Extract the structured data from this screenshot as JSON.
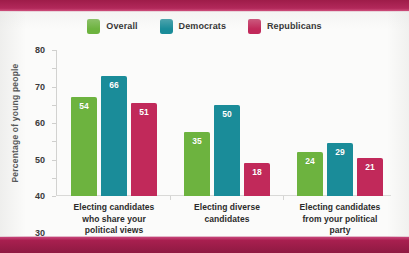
{
  "chart_data": {
    "type": "bar",
    "title": "",
    "subtitle": "",
    "xlabel": "",
    "ylabel": "Percentage of young people",
    "ylim": [
      0,
      80
    ],
    "ytick_step": 10,
    "yticks": [
      80,
      70,
      60,
      50,
      40,
      30,
      20,
      10,
      0
    ],
    "grid": false,
    "legend_position": "top-center",
    "categories": [
      "Electing candidates who share your political views",
      "Electing diverse candidates",
      "Electing candidates from your political party"
    ],
    "category_lines": [
      [
        "Electing candidates",
        "who share your",
        "political views"
      ],
      [
        "Electing diverse",
        "candidates"
      ],
      [
        "Electing candidates",
        "from your political",
        "party"
      ]
    ],
    "series": [
      {
        "name": "Overall",
        "color": "#6db33f",
        "values": [
          54,
          35,
          24
        ]
      },
      {
        "name": "Democrats",
        "color": "#1a8c99",
        "values": [
          66,
          50,
          29
        ]
      },
      {
        "name": "Republicans",
        "color": "#c1295a",
        "values": [
          51,
          18,
          21
        ]
      }
    ]
  },
  "legend": {
    "items": [
      {
        "label": "Overall",
        "swatch": "legend-swatch-overall"
      },
      {
        "label": "Democrats",
        "swatch": "legend-swatch-democrats"
      },
      {
        "label": "Republicans",
        "swatch": "legend-swatch-republicans"
      }
    ]
  },
  "colors": {
    "overall": "#6db33f",
    "democrats": "#1a8c99",
    "republicans": "#c1295a",
    "band": "#a81f4f",
    "page_background": "#fbfbfa",
    "axis": "#d2d2d0",
    "text": "#2b2b2b"
  }
}
